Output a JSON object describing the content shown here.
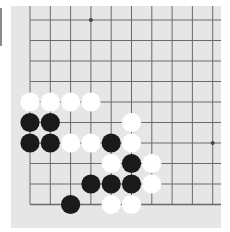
{
  "board": {
    "background": "#e6e6e6",
    "line_color": "#6a6a6a",
    "origin_x": 30,
    "origin_y": 20,
    "spacing_x": 20.3,
    "spacing_y": 20.5,
    "cols": 10,
    "rows": 10,
    "left_edge": true,
    "bottom_edge": true,
    "star_points": [
      [
        3,
        0
      ],
      [
        9,
        6
      ]
    ],
    "stone_radius": 9.6
  },
  "stones": [
    {
      "color": "white",
      "col": 0,
      "row": 4
    },
    {
      "color": "white",
      "col": 1,
      "row": 4
    },
    {
      "color": "white",
      "col": 2,
      "row": 4
    },
    {
      "color": "white",
      "col": 3,
      "row": 4
    },
    {
      "color": "black",
      "col": 0,
      "row": 5
    },
    {
      "color": "black",
      "col": 1,
      "row": 5
    },
    {
      "color": "white",
      "col": 5,
      "row": 5
    },
    {
      "color": "black",
      "col": 0,
      "row": 6
    },
    {
      "color": "black",
      "col": 1,
      "row": 6
    },
    {
      "color": "white",
      "col": 2,
      "row": 6
    },
    {
      "color": "white",
      "col": 3,
      "row": 6
    },
    {
      "color": "black",
      "col": 4,
      "row": 6
    },
    {
      "color": "white",
      "col": 5,
      "row": 6
    },
    {
      "color": "white",
      "col": 4,
      "row": 7
    },
    {
      "color": "black",
      "col": 5,
      "row": 7
    },
    {
      "color": "white",
      "col": 6,
      "row": 7
    },
    {
      "color": "black",
      "col": 3,
      "row": 8
    },
    {
      "color": "black",
      "col": 4,
      "row": 8
    },
    {
      "color": "black",
      "col": 5,
      "row": 8
    },
    {
      "color": "white",
      "col": 6,
      "row": 8
    },
    {
      "color": "black",
      "col": 2,
      "row": 9
    },
    {
      "color": "white",
      "col": 4,
      "row": 9
    },
    {
      "color": "white",
      "col": 5,
      "row": 9
    }
  ],
  "colors": {
    "black": "#1a1a1a",
    "white": "#ffffff"
  }
}
